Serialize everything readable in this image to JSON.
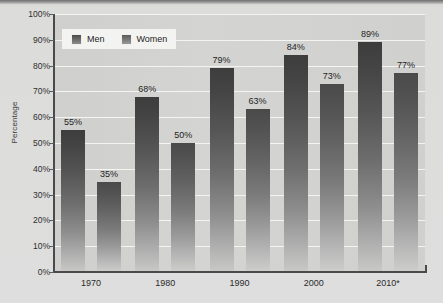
{
  "chart_data": {
    "type": "bar",
    "title": "",
    "xlabel": "",
    "ylabel": "Percentage",
    "ylim": [
      0,
      100
    ],
    "grid": true,
    "legend_position": "top-left",
    "categories": [
      "1970",
      "1980",
      "1990",
      "2000",
      "2010*"
    ],
    "series": [
      {
        "name": "Men",
        "color": "#4a4a4a",
        "values": [
          55,
          68,
          79,
          84,
          89
        ],
        "labels": [
          "55%",
          "68%",
          "79%",
          "84%",
          "89%"
        ]
      },
      {
        "name": "Women",
        "color": "#6a6a6a",
        "values": [
          35,
          50,
          63,
          73,
          77
        ],
        "labels": [
          "35%",
          "50%",
          "63%",
          "73%",
          "77%"
        ]
      }
    ],
    "y_ticks": [
      {
        "value": 100,
        "label": "100%"
      },
      {
        "value": 90,
        "label": "90%"
      },
      {
        "value": 80,
        "label": "80%"
      },
      {
        "value": 70,
        "label": "70%"
      },
      {
        "value": 60,
        "label": "60%"
      },
      {
        "value": 50,
        "label": "50%"
      },
      {
        "value": 40,
        "label": "40%"
      },
      {
        "value": 30,
        "label": "30%"
      },
      {
        "value": 20,
        "label": "20%"
      },
      {
        "value": 10,
        "label": "10%"
      },
      {
        "value": 0,
        "label": "0%"
      }
    ]
  },
  "legend": {
    "items": [
      {
        "label": "Men",
        "swatch": "men-swatch-icon"
      },
      {
        "label": "Women",
        "swatch": "women-swatch-icon"
      }
    ]
  },
  "axes": {
    "y_title": "Percentage"
  },
  "title_partial": ""
}
